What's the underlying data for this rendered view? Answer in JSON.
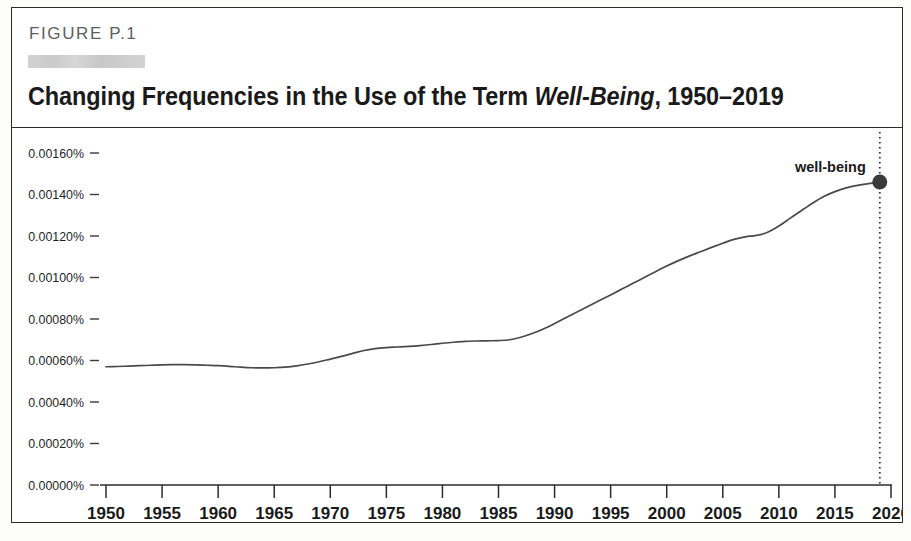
{
  "figure": {
    "kicker": "FIGURE P.1",
    "redaction_present": true,
    "title_prefix": "Changing Frequencies in the Use of the Term ",
    "title_italic": "Well-Being",
    "title_suffix": ", 1950–2019"
  },
  "colors": {
    "frame": "#2b2b2b",
    "line": "#4a4a4a",
    "marker": "#3a3a3a",
    "text": "#1a1a1a",
    "kicker": "#5e5e5e",
    "redaction": "#cfcfcf"
  },
  "chart_data": {
    "type": "line",
    "title": "Changing Frequencies in the Use of the Term Well-Being, 1950–2019",
    "xlabel": "",
    "ylabel": "",
    "xlim": [
      1950,
      2020
    ],
    "ylim": [
      0.0,
      0.0016
    ],
    "grid": false,
    "legend_position": "inline-endpoint",
    "x_tick_labels": [
      "1950",
      "1955",
      "1960",
      "1965",
      "1970",
      "1975",
      "1980",
      "1985",
      "1990",
      "1995",
      "2000",
      "2005",
      "2010",
      "2015",
      "2020"
    ],
    "x_ticks": [
      1950,
      1955,
      1960,
      1965,
      1970,
      1975,
      1980,
      1985,
      1990,
      1995,
      2000,
      2005,
      2010,
      2015,
      2020
    ],
    "y_tick_labels": [
      "0.00000%",
      "0.00020%",
      "0.00040%",
      "0.00060%",
      "0.00080%",
      "0.00100%",
      "0.00120%",
      "0.00140%",
      "0.00160%"
    ],
    "y_ticks": [
      0.0,
      0.0002,
      0.0004,
      0.0006,
      0.0008,
      0.001,
      0.0012,
      0.0014,
      0.0016
    ],
    "annotations": [
      {
        "text": "well-being",
        "x": 2019,
        "y": 0.00146,
        "marker": "filled-circle"
      }
    ],
    "reference_line": {
      "x": 2019,
      "style": "dotted"
    },
    "series": [
      {
        "name": "well-being",
        "x": [
          1950,
          1951,
          1952,
          1953,
          1954,
          1955,
          1956,
          1957,
          1958,
          1959,
          1960,
          1961,
          1962,
          1963,
          1964,
          1965,
          1966,
          1967,
          1968,
          1969,
          1970,
          1971,
          1972,
          1973,
          1974,
          1975,
          1976,
          1977,
          1978,
          1979,
          1980,
          1981,
          1982,
          1983,
          1984,
          1985,
          1986,
          1987,
          1988,
          1989,
          1990,
          1991,
          1992,
          1993,
          1994,
          1995,
          1996,
          1997,
          1998,
          1999,
          2000,
          2001,
          2002,
          2003,
          2004,
          2005,
          2006,
          2007,
          2008,
          2009,
          2010,
          2011,
          2012,
          2013,
          2014,
          2015,
          2016,
          2017,
          2018,
          2019
        ],
        "values": [
          0.00057,
          0.000571,
          0.000573,
          0.000575,
          0.000577,
          0.000579,
          0.00058,
          0.00058,
          0.000579,
          0.000577,
          0.000575,
          0.000572,
          0.000568,
          0.000565,
          0.000564,
          0.000565,
          0.000568,
          0.000574,
          0.000583,
          0.000594,
          0.000607,
          0.00062,
          0.000634,
          0.000648,
          0.000657,
          0.000662,
          0.000665,
          0.000668,
          0.000672,
          0.000677,
          0.000683,
          0.000688,
          0.000692,
          0.000694,
          0.000695,
          0.000696,
          0.0007,
          0.000712,
          0.00073,
          0.000752,
          0.000778,
          0.000806,
          0.000834,
          0.000862,
          0.000889,
          0.000916,
          0.000944,
          0.000972,
          0.001,
          0.001028,
          0.001055,
          0.00108,
          0.001103,
          0.001124,
          0.001145,
          0.001165,
          0.001184,
          0.001196,
          0.001203,
          0.001218,
          0.001248,
          0.001285,
          0.001322,
          0.001358,
          0.00139,
          0.001414,
          0.001432,
          0.001444,
          0.001452,
          0.001458
        ]
      }
    ]
  }
}
